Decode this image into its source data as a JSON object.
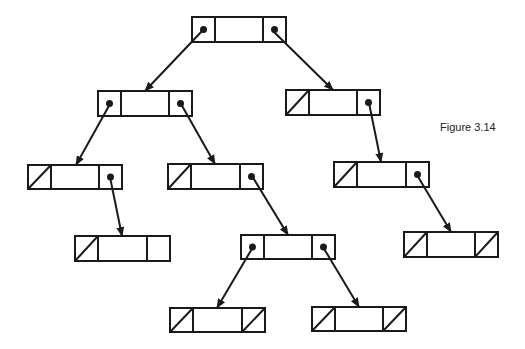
{
  "figure": {
    "caption": "Figure 3.14",
    "caption_pos": {
      "x": 440,
      "y": 121
    },
    "stroke_color": "#1a1a1a",
    "background": "#ffffff"
  },
  "nodes": [
    {
      "id": "root",
      "x": 192,
      "y": 17,
      "w": 94,
      "h": 25,
      "left": "ptr",
      "right": "ptr"
    },
    {
      "id": "L",
      "x": 98,
      "y": 91,
      "w": 94,
      "h": 25,
      "left": "ptr",
      "right": "ptr"
    },
    {
      "id": "R",
      "x": 286,
      "y": 90,
      "w": 94,
      "h": 25,
      "left": "null",
      "right": "ptr"
    },
    {
      "id": "LL",
      "x": 28,
      "y": 165,
      "w": 94,
      "h": 24,
      "left": "null",
      "right": "ptr"
    },
    {
      "id": "LR",
      "x": 168,
      "y": 164,
      "w": 95,
      "h": 25,
      "left": "null",
      "right": "ptr"
    },
    {
      "id": "RR",
      "x": 334,
      "y": 162,
      "w": 95,
      "h": 25,
      "left": "null",
      "right": "ptr"
    },
    {
      "id": "LLR",
      "x": 75,
      "y": 236,
      "w": 95,
      "h": 25,
      "left": "null",
      "right": "empty"
    },
    {
      "id": "LRR",
      "x": 241,
      "y": 235,
      "w": 94,
      "h": 24,
      "left": "ptr",
      "right": "ptr"
    },
    {
      "id": "RRR",
      "x": 404,
      "y": 232,
      "w": 94,
      "h": 25,
      "left": "null",
      "right": "null"
    },
    {
      "id": "LRRL",
      "x": 170,
      "y": 308,
      "w": 95,
      "h": 24,
      "left": "null",
      "right": "null"
    },
    {
      "id": "LRRR",
      "x": 312,
      "y": 307,
      "w": 94,
      "h": 24,
      "left": "null",
      "right": "null"
    }
  ],
  "edges": [
    {
      "from": "root",
      "side": "left",
      "to": "L",
      "x1": 203,
      "y1": 30,
      "x2": 145,
      "y2": 91
    },
    {
      "from": "root",
      "side": "right",
      "to": "R",
      "x1": 273,
      "y1": 31,
      "x2": 333,
      "y2": 90
    },
    {
      "from": "L",
      "side": "left",
      "to": "LL",
      "x1": 110,
      "y1": 104,
      "x2": 76,
      "y2": 165
    },
    {
      "from": "L",
      "side": "right",
      "to": "LR",
      "x1": 181,
      "y1": 104,
      "x2": 215,
      "y2": 164
    },
    {
      "from": "R",
      "side": "right",
      "to": "RR",
      "x1": 369,
      "y1": 103,
      "x2": 381,
      "y2": 162
    },
    {
      "from": "LL",
      "side": "right",
      "to": "LLR",
      "x1": 110,
      "y1": 177,
      "x2": 122,
      "y2": 236
    },
    {
      "from": "LR",
      "side": "right",
      "to": "LRR",
      "x1": 252,
      "y1": 176,
      "x2": 288,
      "y2": 235
    },
    {
      "from": "RR",
      "side": "right",
      "to": "RRR",
      "x1": 417,
      "y1": 175,
      "x2": 451,
      "y2": 232
    },
    {
      "from": "LRR",
      "side": "left",
      "to": "LRRL",
      "x1": 253,
      "y1": 247,
      "x2": 217,
      "y2": 308
    },
    {
      "from": "LRR",
      "side": "right",
      "to": "LRRR",
      "x1": 323,
      "y1": 247,
      "x2": 359,
      "y2": 307
    }
  ]
}
